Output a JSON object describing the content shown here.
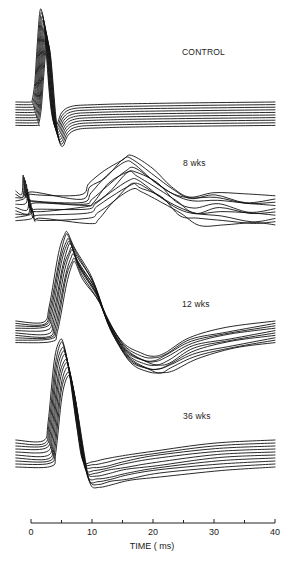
{
  "chart_data": {
    "type": "line",
    "title": "",
    "xlabel": "TIME ( ms)",
    "ylabel": "",
    "xlim": [
      0,
      40
    ],
    "x_ticks_major": [
      0,
      10,
      20,
      30,
      40
    ],
    "x_ticks_minor": [
      5,
      15,
      25,
      35
    ],
    "grid": false,
    "legend": null,
    "panels": [
      {
        "name": "CONTROL",
        "label": "CONTROL",
        "n_traces": 10,
        "points_ms_amp": [
          [
            -2.5,
            0
          ],
          [
            0,
            0
          ],
          [
            0.2,
            0.2
          ],
          [
            0.6,
            2
          ],
          [
            1.0,
            6
          ],
          [
            1.4,
            9.5
          ],
          [
            1.7,
            10
          ],
          [
            2.2,
            8
          ],
          [
            3.0,
            1
          ],
          [
            3.6,
            -2
          ],
          [
            4.2,
            -2.5
          ],
          [
            5.0,
            -1.2
          ],
          [
            6.5,
            -0.5
          ],
          [
            10,
            -0.3
          ],
          [
            20,
            -0.15
          ],
          [
            40,
            0
          ]
        ],
        "features": {
          "peak_ms": 1.7,
          "trough_ms": 4.2
        }
      },
      {
        "name": "8 wks",
        "label": "8 wks",
        "n_traces": 10,
        "points_ms_amp": [
          [
            -2.5,
            0
          ],
          [
            -1.5,
            0
          ],
          [
            -1.3,
            1.5
          ],
          [
            -1.0,
            0
          ],
          [
            0,
            -0.1
          ],
          [
            8,
            -0.2
          ],
          [
            9.5,
            0.5
          ],
          [
            12,
            2
          ],
          [
            15,
            3.6
          ],
          [
            16.5,
            3.8
          ],
          [
            20,
            2
          ],
          [
            23,
            0.5
          ],
          [
            26,
            -0.3
          ],
          [
            30,
            -0.3
          ],
          [
            35,
            -0.6
          ],
          [
            40,
            -0.5
          ]
        ],
        "features": {
          "peak_ms": 16.5
        }
      },
      {
        "name": "12 wks",
        "label": "12 wks",
        "n_traces": 10,
        "points_ms_amp": [
          [
            -2.5,
            0
          ],
          [
            2,
            0
          ],
          [
            3,
            1.5
          ],
          [
            4.5,
            7
          ],
          [
            5.5,
            9.2
          ],
          [
            6,
            9.4
          ],
          [
            7.2,
            7.5
          ],
          [
            10,
            4.5
          ],
          [
            12,
            1
          ],
          [
            15,
            -2.2
          ],
          [
            18,
            -3.5
          ],
          [
            20,
            -3.7
          ],
          [
            22,
            -3.2
          ],
          [
            26,
            -1.8
          ],
          [
            32,
            -0.8
          ],
          [
            40,
            0
          ]
        ],
        "features": {
          "peak_ms": 6.0,
          "trough_ms": 20
        }
      },
      {
        "name": "36 wks",
        "label": "36 wks",
        "n_traces": 10,
        "points_ms_amp": [
          [
            -2.5,
            0
          ],
          [
            2,
            0
          ],
          [
            2.8,
            2
          ],
          [
            3.8,
            9
          ],
          [
            4.7,
            11.5
          ],
          [
            5.3,
            11.2
          ],
          [
            6.2,
            8
          ],
          [
            7.5,
            1.5
          ],
          [
            8.5,
            -2.3
          ],
          [
            10,
            -2.5
          ],
          [
            12,
            -2.3
          ],
          [
            15,
            -1.8
          ],
          [
            20,
            -1.2
          ],
          [
            30,
            -0.4
          ],
          [
            40,
            0
          ]
        ],
        "features": {
          "peak_ms": 4.7,
          "trough_ms": 10
        }
      }
    ]
  },
  "labels": {
    "control": "CONTROL",
    "wk8": "8 wks",
    "wk12": "12 wks",
    "wk36": "36 wks"
  },
  "axis": {
    "title": "TIME ( ms)",
    "ticks": [
      "0",
      "10",
      "20",
      "30",
      "40"
    ]
  }
}
